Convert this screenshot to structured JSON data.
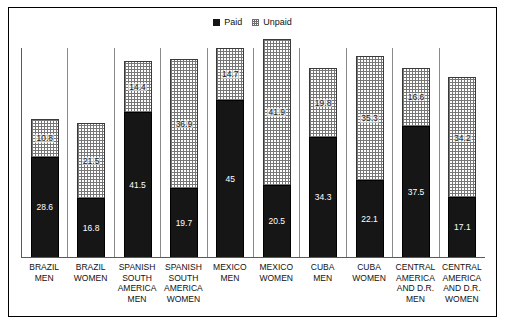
{
  "legend": {
    "items": [
      {
        "label": "Paid",
        "swatch": "filled-black-square-icon",
        "color": "#161616"
      },
      {
        "label": "Unpaid",
        "swatch": "dotted-square-icon",
        "color": "#777777"
      }
    ]
  },
  "chart_data": {
    "type": "bar",
    "stacked": true,
    "title": "",
    "subtitle": "",
    "xlabel": "",
    "ylabel": "",
    "ylim": [
      0,
      60
    ],
    "grid": false,
    "legend_position": "top-center",
    "categories": [
      "BRAZIL MEN",
      "BRAZIL WOMEN",
      "SPANISH SOUTH AMERICA MEN",
      "SPANISH SOUTH AMERICA WOMEN",
      "MEXICO MEN",
      "MEXICO WOMEN",
      "CUBA MEN",
      "CUBA WOMEN",
      "CENTRAL AMERICA AND D.R. MEN",
      "CENTRAL AMERICA AND D.R. WOMEN"
    ],
    "category_lines": [
      [
        "BRAZIL",
        "MEN"
      ],
      [
        "BRAZIL",
        "WOMEN"
      ],
      [
        "SPANISH",
        "SOUTH",
        "AMERICA",
        "MEN"
      ],
      [
        "SPANISH",
        "SOUTH",
        "AMERICA",
        "WOMEN"
      ],
      [
        "MEXICO",
        "MEN"
      ],
      [
        "MEXICO",
        "WOMEN"
      ],
      [
        "CUBA",
        "MEN"
      ],
      [
        "CUBA",
        "WOMEN"
      ],
      [
        "CENTRAL",
        "AMERICA",
        "AND D.R.",
        "MEN"
      ],
      [
        "CENTRAL",
        "AMERICA",
        "AND D.R.",
        "WOMEN"
      ]
    ],
    "series": [
      {
        "name": "Paid",
        "values": [
          28.6,
          16.8,
          41.5,
          19.7,
          45,
          20.5,
          34.3,
          22.1,
          37.5,
          17.1
        ]
      },
      {
        "name": "Unpaid",
        "values": [
          10.8,
          21.5,
          14.4,
          36.9,
          14.7,
          41.9,
          19.8,
          35.3,
          16.6,
          34.2
        ]
      }
    ],
    "bars": [
      {
        "category": "BRAZIL MEN",
        "paid": 28.6,
        "unpaid": 10.8,
        "total": 39.4
      },
      {
        "category": "BRAZIL WOMEN",
        "paid": 16.8,
        "unpaid": 21.5,
        "total": 38.3
      },
      {
        "category": "SPANISH SOUTH AMERICA MEN",
        "paid": 41.5,
        "unpaid": 14.4,
        "total": 55.9
      },
      {
        "category": "SPANISH SOUTH AMERICA WOMEN",
        "paid": 19.7,
        "unpaid": 36.9,
        "total": 56.6
      },
      {
        "category": "MEXICO MEN",
        "paid": 45,
        "unpaid": 14.7,
        "total": 59.7
      },
      {
        "category": "MEXICO WOMEN",
        "paid": 20.5,
        "unpaid": 41.9,
        "total": 62.4
      },
      {
        "category": "CUBA MEN",
        "paid": 34.3,
        "unpaid": 19.8,
        "total": 54.1
      },
      {
        "category": "CUBA WOMEN",
        "paid": 22.1,
        "unpaid": 35.3,
        "total": 57.4
      },
      {
        "category": "CENTRAL AMERICA AND D.R. MEN",
        "paid": 37.5,
        "unpaid": 16.6,
        "total": 54.1
      },
      {
        "category": "CENTRAL AMERICA AND D.R. WOMEN",
        "paid": 17.1,
        "unpaid": 34.2,
        "total": 51.3
      }
    ],
    "paid_labels": [
      "28.6",
      "16.8",
      "41.5",
      "19.7",
      "45",
      "20.5",
      "34.3",
      "22.1",
      "37.5",
      "17.1"
    ],
    "unpaid_labels": [
      "10.8",
      "21.5",
      "14.4",
      "36.9",
      "14.7",
      "41.9",
      "19.8",
      "35.3",
      "16.6",
      "34.2"
    ]
  }
}
